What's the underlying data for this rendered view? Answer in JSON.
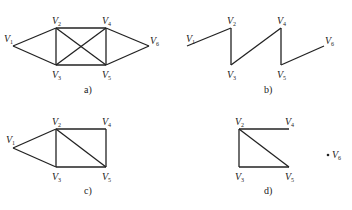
{
  "panels": [
    {
      "id": "a",
      "caption": "a)",
      "caption_pos": [
        84,
        93
      ],
      "vertices": [
        {
          "name": "V",
          "sub": "1",
          "pos": [
            13,
            46
          ],
          "label_pos": [
            4,
            42
          ]
        },
        {
          "name": "V",
          "sub": "2",
          "pos": [
            56,
            28
          ],
          "label_pos": [
            52,
            24
          ]
        },
        {
          "name": "V",
          "sub": "3",
          "pos": [
            56,
            65
          ],
          "label_pos": [
            52,
            78
          ]
        },
        {
          "name": "V",
          "sub": "4",
          "pos": [
            106,
            28
          ],
          "label_pos": [
            102,
            24
          ]
        },
        {
          "name": "V",
          "sub": "5",
          "pos": [
            106,
            65
          ],
          "label_pos": [
            102,
            78
          ]
        },
        {
          "name": "V",
          "sub": "6",
          "pos": [
            149,
            46
          ],
          "label_pos": [
            150,
            44
          ]
        }
      ],
      "edges": [
        [
          1,
          2
        ],
        [
          1,
          3
        ],
        [
          2,
          4
        ],
        [
          2,
          3
        ],
        [
          2,
          5
        ],
        [
          3,
          4
        ],
        [
          3,
          5
        ],
        [
          4,
          5
        ],
        [
          4,
          6
        ],
        [
          5,
          6
        ]
      ]
    },
    {
      "id": "b",
      "caption": "b)",
      "caption_pos": [
        264,
        93
      ],
      "vertices": [
        {
          "name": "V",
          "sub": "1",
          "pos": [
            187,
            46
          ],
          "label_pos": [
            186,
            42
          ]
        },
        {
          "name": "V",
          "sub": "2",
          "pos": [
            231,
            28
          ],
          "label_pos": [
            227,
            24
          ]
        },
        {
          "name": "V",
          "sub": "3",
          "pos": [
            231,
            65
          ],
          "label_pos": [
            227,
            78
          ]
        },
        {
          "name": "V",
          "sub": "4",
          "pos": [
            281,
            28
          ],
          "label_pos": [
            277,
            24
          ]
        },
        {
          "name": "V",
          "sub": "5",
          "pos": [
            281,
            65
          ],
          "label_pos": [
            277,
            78
          ]
        },
        {
          "name": "V",
          "sub": "6",
          "pos": [
            324,
            46
          ],
          "label_pos": [
            325,
            44
          ]
        }
      ],
      "edges": [
        [
          1,
          2
        ],
        [
          2,
          3
        ],
        [
          3,
          4
        ],
        [
          4,
          5
        ],
        [
          5,
          6
        ]
      ]
    },
    {
      "id": "c",
      "caption": "c)",
      "caption_pos": [
        84,
        194
      ],
      "vertices": [
        {
          "name": "V",
          "sub": "1",
          "pos": [
            13,
            148
          ],
          "label_pos": [
            6,
            143
          ]
        },
        {
          "name": "V",
          "sub": "2",
          "pos": [
            56,
            129
          ],
          "label_pos": [
            52,
            125
          ]
        },
        {
          "name": "V",
          "sub": "3",
          "pos": [
            56,
            167
          ],
          "label_pos": [
            52,
            180
          ]
        },
        {
          "name": "V",
          "sub": "4",
          "pos": [
            106,
            129
          ],
          "label_pos": [
            102,
            125
          ]
        },
        {
          "name": "V",
          "sub": "5",
          "pos": [
            106,
            167
          ],
          "label_pos": [
            102,
            180
          ]
        }
      ],
      "edges": [
        [
          1,
          2
        ],
        [
          1,
          3
        ],
        [
          2,
          4
        ],
        [
          2,
          3
        ],
        [
          2,
          5
        ],
        [
          4,
          5
        ],
        [
          3,
          5
        ]
      ]
    },
    {
      "id": "d",
      "caption": "d)",
      "caption_pos": [
        264,
        194
      ],
      "vertices": [
        {
          "name": "V",
          "sub": "2",
          "pos": [
            239,
            129
          ],
          "label_pos": [
            235,
            125
          ]
        },
        {
          "name": "V",
          "sub": "3",
          "pos": [
            239,
            167
          ],
          "label_pos": [
            235,
            180
          ]
        },
        {
          "name": "V",
          "sub": "4",
          "pos": [
            289,
            129
          ],
          "label_pos": [
            285,
            125
          ]
        },
        {
          "name": "V",
          "sub": "5",
          "pos": [
            289,
            167
          ],
          "label_pos": [
            285,
            180
          ]
        },
        {
          "name": "V",
          "sub": "6",
          "pos": [
            328,
            155
          ],
          "label_pos": [
            332,
            158
          ],
          "isolated": true
        }
      ],
      "edges": [
        [
          2,
          4
        ],
        [
          2,
          3
        ],
        [
          2,
          5
        ],
        [
          3,
          5
        ]
      ]
    }
  ],
  "colors": {
    "stroke": "#222222",
    "background": "#ffffff"
  }
}
